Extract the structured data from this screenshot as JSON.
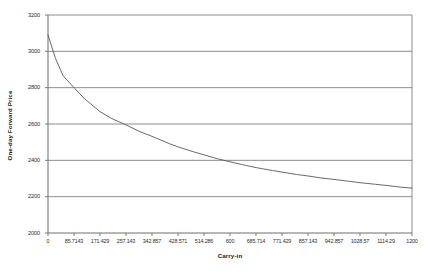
{
  "chart_data": {
    "type": "line",
    "title": "",
    "xlabel": "Carry-in",
    "ylabel": "One-day Forward Price",
    "xlim": [
      0,
      1200
    ],
    "ylim": [
      2000,
      3200
    ],
    "grid": true,
    "grid_axis": "y",
    "legend": false,
    "legend_position": "none",
    "line_color": "#595959",
    "gridline_color": "#808080",
    "axis_color": "#808080",
    "plot_background": "#ffffff",
    "xticklabels": [
      "0",
      "85.7143",
      "171.429",
      "257.143",
      "342.857",
      "428.571",
      "514.286",
      "600",
      "685.714",
      "771.429",
      "857.143",
      "942.857",
      "1028.57",
      "1114.29",
      "1200"
    ],
    "xtickvalues": [
      0,
      85.7143,
      171.429,
      257.143,
      342.857,
      428.571,
      514.286,
      600,
      685.714,
      771.429,
      857.143,
      942.857,
      1028.57,
      1114.29,
      1200
    ],
    "yticklabels": [
      "2000",
      "2200",
      "2400",
      "2600",
      "2800",
      "3000",
      "3200"
    ],
    "ytickvalues": [
      2000,
      2200,
      2400,
      2600,
      2800,
      3000,
      3200
    ],
    "series": [
      {
        "name": "One-day Forward Price",
        "x": [
          0,
          25,
          50,
          85.7143,
          120,
          171.429,
          210,
          257.143,
          300,
          342.857,
          400,
          428.571,
          480,
          514.286,
          560,
          600,
          650,
          685.714,
          740,
          771.429,
          820,
          857.143,
          900,
          942.857,
          1000,
          1028.57,
          1080,
          1114.29,
          1160,
          1200
        ],
        "values": [
          3090,
          2960,
          2865,
          2800,
          2740,
          2668,
          2630,
          2595,
          2560,
          2532,
          2492,
          2474,
          2447,
          2430,
          2408,
          2392,
          2373,
          2360,
          2344,
          2335,
          2322,
          2314,
          2303,
          2295,
          2283,
          2277,
          2268,
          2262,
          2253,
          2247
        ]
      }
    ]
  },
  "axes": {
    "y_title": "One-day Forward Price",
    "x_title": "Carry-in"
  }
}
